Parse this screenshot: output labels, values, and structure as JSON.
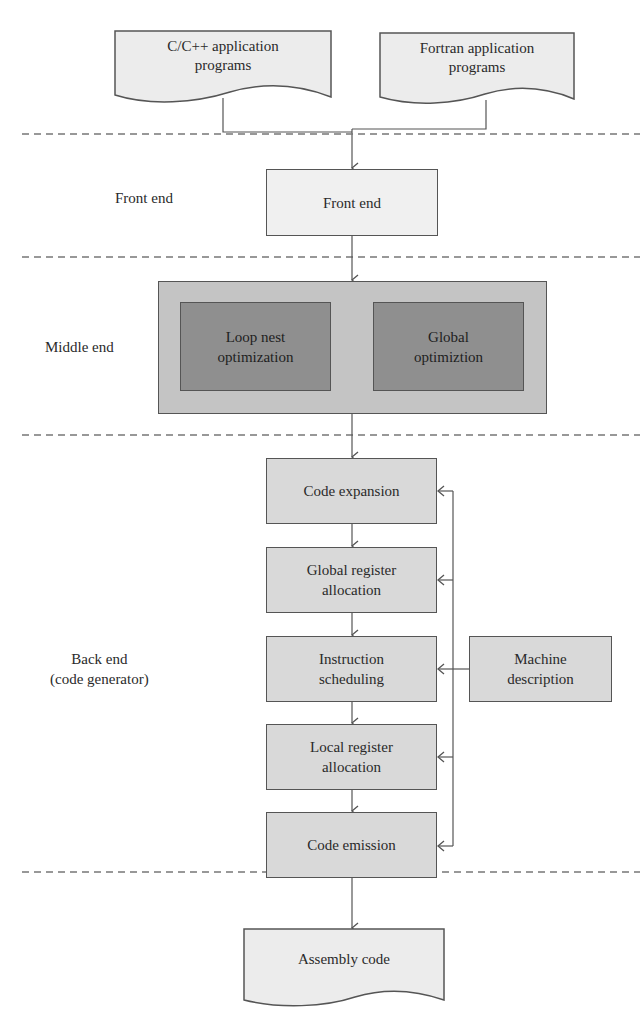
{
  "inputs": {
    "cpp": {
      "label_line1": "C/C++ application",
      "label_line2": "programs"
    },
    "fortran": {
      "label_line1": "Fortran application",
      "label_line2": "programs"
    }
  },
  "stages": {
    "front_end": {
      "side_label": "Front end",
      "box_label": "Front end"
    },
    "middle_end": {
      "side_label": "Middle end",
      "boxes": [
        {
          "line1": "Loop nest",
          "line2": "optimization"
        },
        {
          "line1": "Global",
          "line2": "optimiztion"
        }
      ]
    },
    "back_end": {
      "side_label_line1": "Back end",
      "side_label_line2": "(code generator)",
      "steps": [
        {
          "line1": "Code expansion",
          "line2": ""
        },
        {
          "line1": "Global register",
          "line2": "allocation"
        },
        {
          "line1": "Instruction",
          "line2": "scheduling"
        },
        {
          "line1": "Local register",
          "line2": "allocation"
        },
        {
          "line1": "Code emission",
          "line2": ""
        }
      ],
      "machine_description": {
        "line1": "Machine",
        "line2": "description"
      }
    }
  },
  "output": {
    "label": "Assembly code"
  },
  "colors": {
    "document_fill": "#ececec",
    "front_end_fill": "#f0f0f0",
    "middle_outer_fill": "#c4c4c4",
    "middle_inner_fill": "#8f8f8f",
    "back_end_fill": "#d9d9d9",
    "line": "#555555"
  }
}
